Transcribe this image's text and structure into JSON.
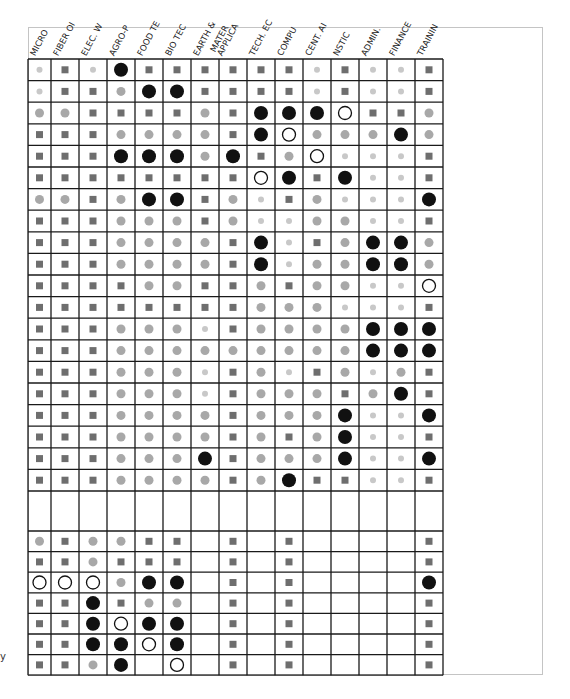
{
  "chart_data": {
    "type": "table",
    "title": "",
    "legend_symbols": {
      "lt": {
        "meaning": "small light-gray dot",
        "color": "#c8c8c8"
      },
      "sq": {
        "meaning": "dark-gray square",
        "color": "#6e6e6e"
      },
      "md": {
        "meaning": "medium-gray circle",
        "color": "#a8a8a8"
      },
      "bk": {
        "meaning": "large black circle",
        "color": "#111111"
      },
      "op": {
        "meaning": "open circle",
        "color": "#111111"
      },
      "": {
        "meaning": "empty"
      }
    },
    "columns": [
      "MICRO",
      "FIBER OI",
      "ELEC. W",
      "AGRO-P",
      "FOOD TE",
      "BIO TEC",
      "EARTH &",
      "MATER\nAPPLICA",
      "TECH. EC",
      "COMPU",
      "CENT. AI",
      "NSTIC",
      "ADMIN.",
      "FINANCE",
      "TRAININ"
    ],
    "sections": [
      {
        "rows": [
          [
            "lt",
            "sq",
            "lt",
            "bk",
            "sq",
            "sq",
            "sq",
            "sq",
            "sq",
            "sq",
            "lt",
            "sq",
            "lt",
            "lt",
            "sq"
          ],
          [
            "lt",
            "sq",
            "sq",
            "md",
            "bk",
            "bk",
            "sq",
            "sq",
            "sq",
            "sq",
            "lt",
            "sq",
            "lt",
            "lt",
            "sq"
          ],
          [
            "md",
            "md",
            "sq",
            "sq",
            "sq",
            "sq",
            "md",
            "sq",
            "bk",
            "bk",
            "bk",
            "op",
            "sq",
            "sq",
            "md"
          ],
          [
            "sq",
            "sq",
            "sq",
            "md",
            "md",
            "md",
            "md",
            "sq",
            "bk",
            "op",
            "md",
            "md",
            "md",
            "bk",
            "md"
          ],
          [
            "sq",
            "sq",
            "sq",
            "bk",
            "bk",
            "bk",
            "md",
            "bk",
            "sq",
            "md",
            "op",
            "lt",
            "lt",
            "lt",
            "sq"
          ],
          [
            "sq",
            "sq",
            "sq",
            "sq",
            "sq",
            "sq",
            "sq",
            "sq",
            "op",
            "bk",
            "sq",
            "bk",
            "lt",
            "lt",
            "sq"
          ],
          [
            "md",
            "md",
            "sq",
            "md",
            "bk",
            "bk",
            "sq",
            "md",
            "lt",
            "sq",
            "md",
            "lt",
            "lt",
            "lt",
            "bk"
          ],
          [
            "sq",
            "sq",
            "sq",
            "md",
            "md",
            "md",
            "sq",
            "md",
            "lt",
            "lt",
            "md",
            "md",
            "lt",
            "lt",
            "sq"
          ],
          [
            "sq",
            "sq",
            "sq",
            "md",
            "md",
            "md",
            "md",
            "sq",
            "bk",
            "lt",
            "sq",
            "md",
            "bk",
            "bk",
            "md"
          ],
          [
            "sq",
            "sq",
            "sq",
            "md",
            "md",
            "md",
            "md",
            "sq",
            "bk",
            "lt",
            "md",
            "md",
            "bk",
            "bk",
            "md"
          ],
          [
            "sq",
            "sq",
            "sq",
            "sq",
            "md",
            "md",
            "sq",
            "sq",
            "md",
            "sq",
            "md",
            "md",
            "lt",
            "lt",
            "op"
          ],
          [
            "sq",
            "sq",
            "sq",
            "sq",
            "sq",
            "sq",
            "sq",
            "sq",
            "md",
            "md",
            "md",
            "lt",
            "lt",
            "lt",
            "sq"
          ],
          [
            "sq",
            "sq",
            "sq",
            "md",
            "md",
            "md",
            "lt",
            "sq",
            "md",
            "md",
            "md",
            "md",
            "bk",
            "bk",
            "bk"
          ],
          [
            "sq",
            "sq",
            "sq",
            "md",
            "md",
            "md",
            "md",
            "md",
            "md",
            "md",
            "md",
            "md",
            "bk",
            "bk",
            "bk"
          ],
          [
            "sq",
            "sq",
            "sq",
            "md",
            "md",
            "md",
            "lt",
            "sq",
            "md",
            "lt",
            "sq",
            "md",
            "lt",
            "md",
            "sq"
          ],
          [
            "sq",
            "sq",
            "sq",
            "md",
            "md",
            "md",
            "lt",
            "sq",
            "md",
            "md",
            "md",
            "sq",
            "md",
            "bk",
            "sq"
          ],
          [
            "sq",
            "sq",
            "sq",
            "md",
            "md",
            "md",
            "md",
            "sq",
            "md",
            "md",
            "md",
            "bk",
            "lt",
            "lt",
            "bk"
          ],
          [
            "sq",
            "sq",
            "sq",
            "md",
            "md",
            "md",
            "md",
            "sq",
            "md",
            "sq",
            "md",
            "bk",
            "lt",
            "lt",
            "sq"
          ],
          [
            "sq",
            "sq",
            "sq",
            "md",
            "md",
            "md",
            "bk",
            "sq",
            "md",
            "md",
            "md",
            "bk",
            "lt",
            "lt",
            "bk"
          ],
          [
            "sq",
            "sq",
            "sq",
            "md",
            "md",
            "md",
            "md",
            "sq",
            "md",
            "bk",
            "sq",
            "sq",
            "lt",
            "lt",
            "sq"
          ]
        ]
      },
      {
        "rows": [
          [
            "",
            "",
            "",
            "",
            "",
            "",
            "",
            "",
            "",
            "",
            "",
            "",
            "",
            "",
            ""
          ]
        ]
      },
      {
        "rows": [
          [
            "md",
            "sq",
            "md",
            "md",
            "sq",
            "sq",
            "",
            "sq",
            "",
            "sq",
            "",
            "",
            "",
            "",
            "sq"
          ],
          [
            "sq",
            "sq",
            "md",
            "sq",
            "sq",
            "sq",
            "",
            "sq",
            "",
            "sq",
            "",
            "",
            "",
            "",
            "sq"
          ],
          [
            "op",
            "op",
            "op",
            "md",
            "bk",
            "bk",
            "",
            "sq",
            "",
            "sq",
            "",
            "",
            "",
            "",
            "bk"
          ],
          [
            "sq",
            "sq",
            "bk",
            "sq",
            "md",
            "md",
            "",
            "sq",
            "",
            "sq",
            "",
            "",
            "",
            "",
            "sq"
          ],
          [
            "sq",
            "sq",
            "bk",
            "op",
            "bk",
            "bk",
            "",
            "sq",
            "",
            "sq",
            "",
            "",
            "",
            "",
            "sq"
          ],
          [
            "sq",
            "sq",
            "bk",
            "bk",
            "op",
            "bk",
            "",
            "sq",
            "",
            "sq",
            "",
            "",
            "",
            "",
            "sq"
          ],
          [
            "sq",
            "sq",
            "md",
            "bk",
            "",
            "op",
            "",
            "sq",
            "",
            "sq",
            "",
            "",
            "",
            "",
            "sq"
          ]
        ]
      }
    ]
  },
  "side_glyph": "y"
}
